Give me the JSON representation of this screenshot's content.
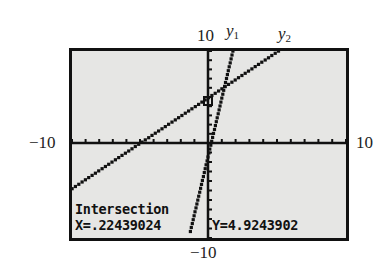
{
  "window": {
    "ymax_label": "10",
    "ymin_label": "−10",
    "xmin_label": "−10",
    "xmax_label": "10",
    "curve_labels": [
      {
        "base": "y",
        "sub": "1"
      },
      {
        "base": "y",
        "sub": "2"
      }
    ]
  },
  "readout": {
    "title": "Intersection",
    "x_text": "X=.22439024",
    "y_text": "Y=4.9243902"
  },
  "colors": {
    "screen_bg": "#e6e6e4",
    "ink": "#111111"
  },
  "chart_data": {
    "type": "line",
    "xlabel": "",
    "ylabel": "",
    "xlim": [
      -10,
      10
    ],
    "ylim": [
      -10,
      10
    ],
    "xscl": 1,
    "yscl": 1,
    "grid": false,
    "series": [
      {
        "name": "y1",
        "x": [
          -1.3,
          1.8
        ],
        "y": [
          -9.3,
          10
        ],
        "style": "dotted-steep"
      },
      {
        "name": "y2",
        "x": [
          -10,
          5.1
        ],
        "y": [
          -4.8,
          10
        ],
        "style": "dotted-shallow"
      }
    ],
    "annotations": [
      {
        "type": "intersection",
        "x": 0.22439024,
        "y": 4.9243902,
        "label": "Intersection"
      }
    ]
  }
}
